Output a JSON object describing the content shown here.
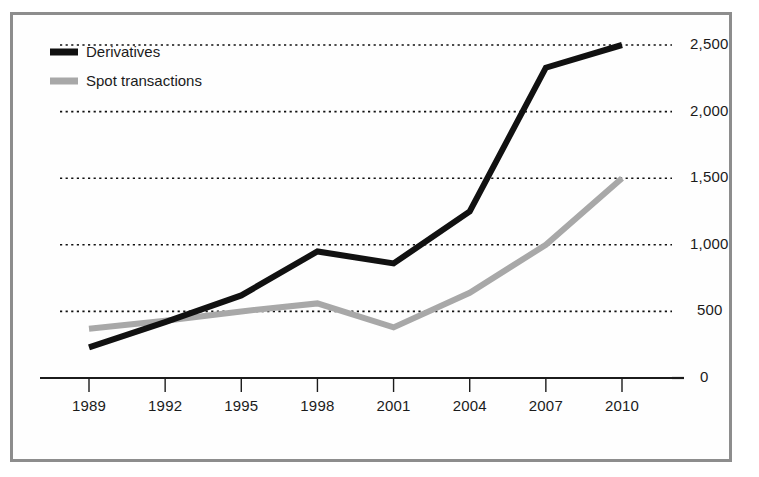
{
  "figure": {
    "frame_color": "#8d8d8d",
    "background": "#ffffff"
  },
  "legend": {
    "position": "top-left",
    "entries": [
      {
        "label": "Derivatives",
        "color": "#111111",
        "swatch_name": "legend-swatch-derivatives"
      },
      {
        "label": "Spot transactions",
        "color": "#a8a8a8",
        "swatch_name": "legend-swatch-spot-transactions"
      }
    ]
  },
  "axes": {
    "y_ticks": [
      "0",
      "500",
      "1,000",
      "1,500",
      "2,000",
      "2,500"
    ],
    "y_tick_values": [
      0,
      500,
      1000,
      1500,
      2000,
      2500
    ],
    "x_ticks": [
      "1989",
      "1992",
      "1995",
      "1998",
      "2001",
      "2004",
      "2007",
      "2010"
    ],
    "y_axis_side": "right",
    "grid": "horizontal-dotted"
  },
  "chart_data": {
    "type": "line",
    "title": "",
    "subtitle": "",
    "xlabel": "",
    "ylabel": "",
    "categories": [
      "1989",
      "1992",
      "1995",
      "1998",
      "2001",
      "2004",
      "2007",
      "2010"
    ],
    "x": [
      1989,
      1992,
      1995,
      1998,
      2001,
      2004,
      2007,
      2010
    ],
    "series": [
      {
        "name": "Derivatives",
        "color": "#111111",
        "line_width": 6,
        "values": [
          230,
          420,
          620,
          950,
          860,
          1250,
          2330,
          2500
        ]
      },
      {
        "name": "Spot transactions",
        "color": "#a8a8a8",
        "line_width": 6,
        "values": [
          370,
          430,
          500,
          560,
          380,
          640,
          1000,
          1500
        ]
      }
    ],
    "ylim": [
      0,
      2600
    ],
    "xlim": [
      1989,
      2010
    ],
    "grid": true,
    "gridlines_at": [
      500,
      1000,
      1500,
      2000,
      2500
    ],
    "legend_position": "top-left",
    "annotations": []
  }
}
